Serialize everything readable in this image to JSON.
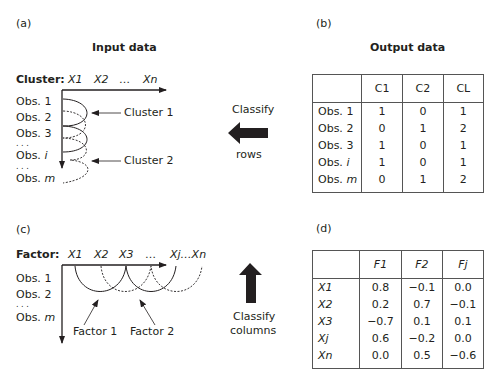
{
  "panel_a": {
    "label": "(a)",
    "title": "Input data",
    "axis_label": "Cluster:",
    "columns": [
      "X1",
      "X2",
      "…",
      "Xn"
    ],
    "rows": [
      {
        "prefix": "Obs. ",
        "suffix": "1"
      },
      {
        "prefix": "Obs. ",
        "suffix": "2"
      },
      {
        "prefix": "Obs. ",
        "suffix": "3"
      },
      {
        "prefix": ". . .",
        "suffix": ""
      },
      {
        "prefix": "Obs. ",
        "suffix": "i"
      },
      {
        "prefix": ". . .",
        "suffix": ""
      },
      {
        "prefix": "Obs. ",
        "suffix": "m"
      }
    ],
    "callouts": [
      "Cluster 1",
      "Cluster 2"
    ]
  },
  "panel_b": {
    "label": "(b)",
    "title": "Output data",
    "headers": [
      "",
      "C1",
      "C2",
      "CL"
    ],
    "rows": [
      {
        "prefix": "Obs. ",
        "suffix": "1",
        "values": [
          "1",
          "0",
          "1"
        ]
      },
      {
        "prefix": "Obs. ",
        "suffix": "2",
        "values": [
          "0",
          "1",
          "2"
        ]
      },
      {
        "prefix": "Obs. ",
        "suffix": "3",
        "values": [
          "1",
          "0",
          "1"
        ]
      },
      {
        "prefix": "Obs. ",
        "suffix": "i",
        "values": [
          "1",
          "0",
          "1"
        ]
      },
      {
        "prefix": "Obs. ",
        "suffix": "m",
        "values": [
          "0",
          "1",
          "2"
        ]
      }
    ]
  },
  "arrow_rows": {
    "line1": "Classify",
    "line2": "rows",
    "direction": "left"
  },
  "panel_c": {
    "label": "(c)",
    "axis_label": "Factor:",
    "columns": [
      "X1",
      "X2",
      "X3",
      "…",
      "Xj…Xn"
    ],
    "rows": [
      {
        "prefix": "Obs. ",
        "suffix": "1"
      },
      {
        "prefix": "Obs. ",
        "suffix": "2"
      },
      {
        "prefix": ". . .",
        "suffix": ""
      },
      {
        "prefix": "Obs. ",
        "suffix": "m"
      }
    ],
    "callouts": [
      "Factor 1",
      "Factor 2"
    ]
  },
  "arrow_columns": {
    "line1": "Classify",
    "line2": "columns",
    "direction": "up"
  },
  "panel_d": {
    "label": "(d)",
    "headers": [
      "",
      "F1",
      "F2",
      "Fj"
    ],
    "rows": [
      {
        "name": "X1",
        "values": [
          "0.8",
          "−0.1",
          "0.0"
        ]
      },
      {
        "name": "X2",
        "values": [
          "0.2",
          "0.7",
          "−0.1"
        ]
      },
      {
        "name": "X3",
        "values": [
          "−0.7",
          "0.1",
          "0.1"
        ]
      },
      {
        "name": "Xj",
        "values": [
          "0.6",
          "−0.2",
          "0.0"
        ]
      },
      {
        "name": "Xn",
        "values": [
          "0.0",
          "0.5",
          "−0.6"
        ]
      }
    ]
  }
}
